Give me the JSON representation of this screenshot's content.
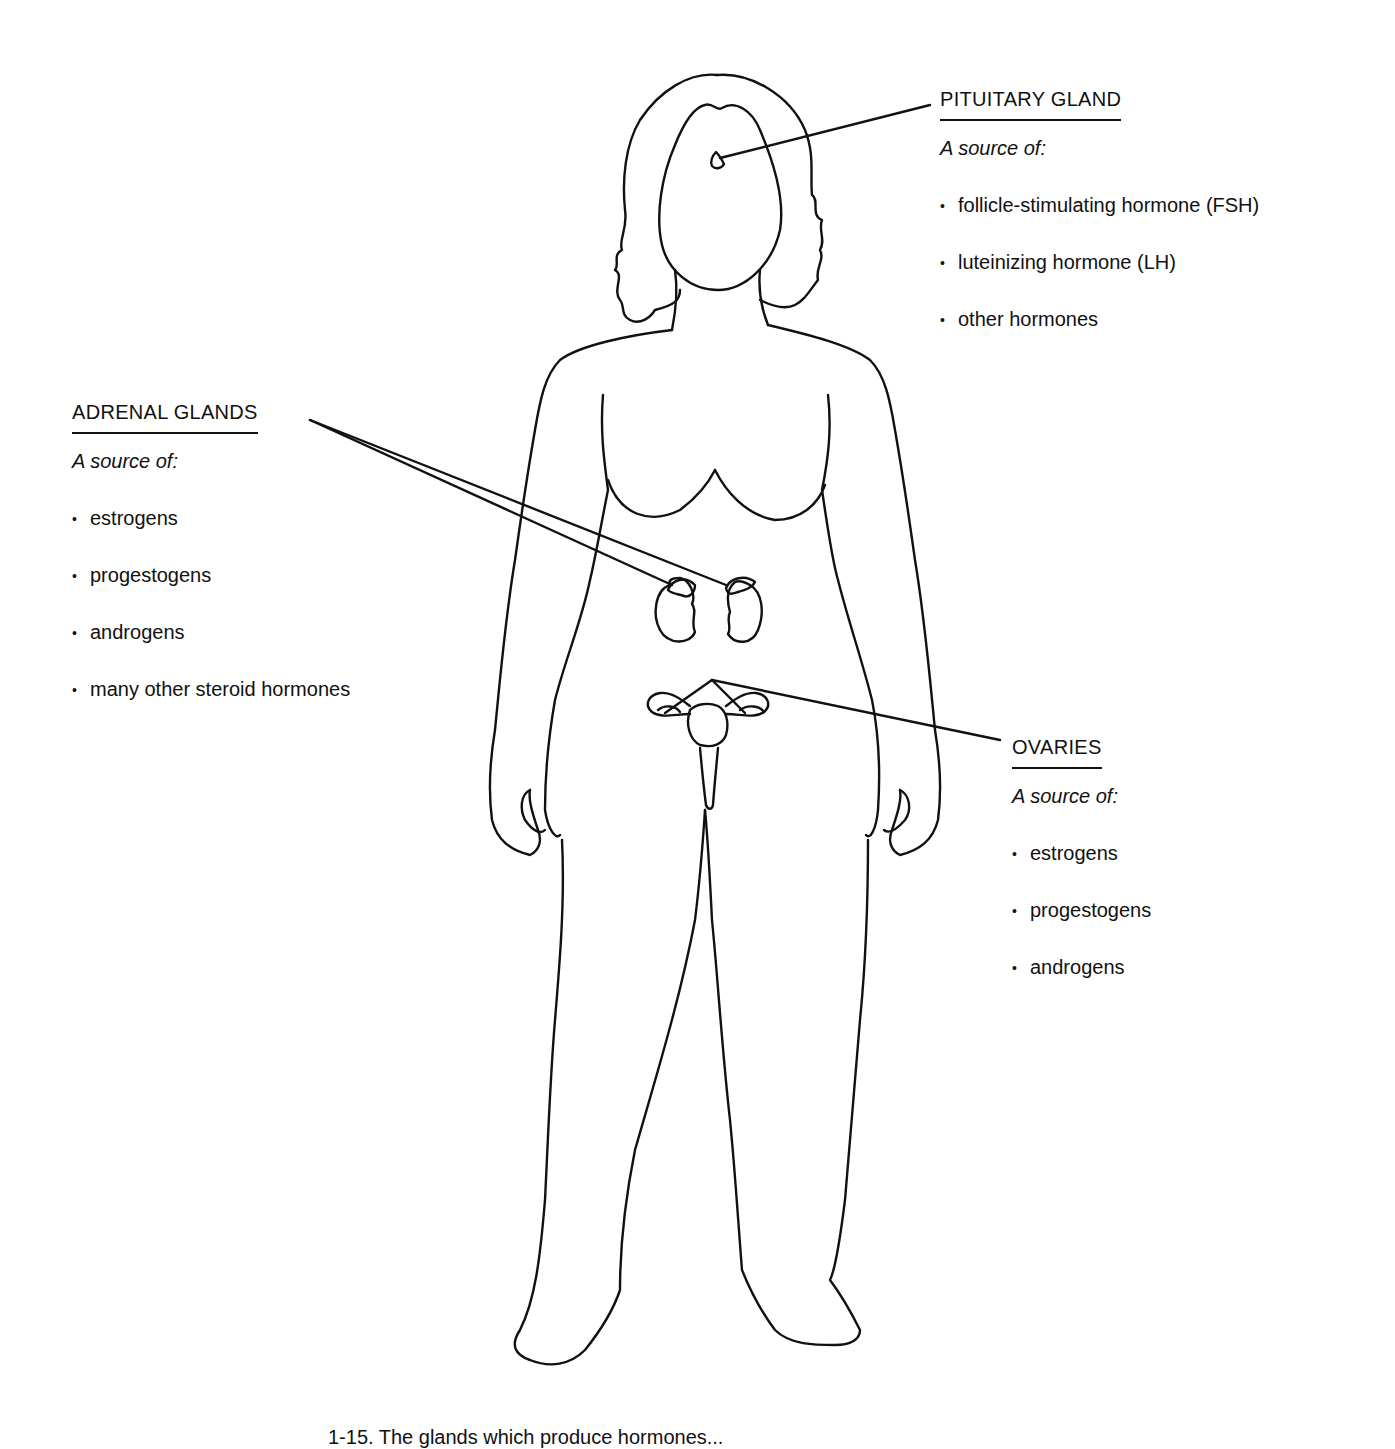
{
  "figure": {
    "line_color": "#111111",
    "background": "#ffffff"
  },
  "labels": {
    "pituitary": {
      "title": "PITUITARY GLAND",
      "subtitle": "A source of:",
      "items": [
        "follicle-stimulating hormone (FSH)",
        "luteinizing hormone (LH)",
        "other hormones"
      ]
    },
    "adrenal": {
      "title": "ADRENAL GLANDS",
      "subtitle": "A source of:",
      "items": [
        "estrogens",
        "progestogens",
        "androgens",
        "many other steroid hormones"
      ]
    },
    "ovaries": {
      "title": "OVARIES",
      "subtitle": "A source of:",
      "items": [
        "estrogens",
        "progestogens",
        "androgens"
      ]
    }
  },
  "caption": {
    "text": "1-15. The glands which produce hormones..."
  }
}
